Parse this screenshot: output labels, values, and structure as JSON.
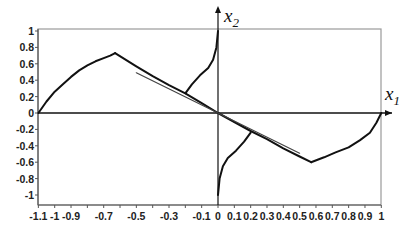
{
  "chart_data": {
    "type": "line",
    "title": "",
    "xlabel": "x1",
    "ylabel": "x2",
    "xlabel_parts": {
      "base": "x",
      "sub": "1"
    },
    "ylabel_parts": {
      "base": "x",
      "sub": "2"
    },
    "xlim": [
      -1.1,
      1.0
    ],
    "ylim": [
      -1.1,
      1.05
    ],
    "grid": false,
    "legend": null,
    "x_ticks": [
      "-1.1",
      "-1",
      "-0.9",
      "-0.7",
      "-0.5",
      "-0.3",
      "-0.1",
      "0",
      "0.1",
      "0.2",
      "0.3",
      "0.4",
      "0.5",
      "0.6",
      "0.7",
      "0.8",
      "0.9",
      "1"
    ],
    "x_tick_values": [
      -1.1,
      -1.0,
      -0.9,
      -0.7,
      -0.5,
      -0.3,
      -0.1,
      0,
      0.1,
      0.2,
      0.3,
      0.4,
      0.5,
      0.6,
      0.7,
      0.8,
      0.9,
      1.0
    ],
    "y_ticks": [
      "1",
      "0.8",
      "0.6",
      "0.4",
      "0.2",
      "0",
      "-0.2",
      "-0.4",
      "-0.6",
      "-0.8",
      "-1"
    ],
    "y_tick_values": [
      1,
      0.8,
      0.6,
      0.4,
      0.2,
      0,
      -0.2,
      -0.4,
      -0.6,
      -0.8,
      -1
    ],
    "series": [
      {
        "name": "trajectory-left-arc",
        "x": [
          -1.1,
          -1.05,
          -1.0,
          -0.95,
          -0.9,
          -0.85,
          -0.8,
          -0.75,
          -0.7,
          -0.66,
          -0.63
        ],
        "y": [
          0.0,
          0.14,
          0.26,
          0.35,
          0.44,
          0.52,
          0.58,
          0.63,
          0.67,
          0.7,
          0.73
        ]
      },
      {
        "name": "trajectory-diagonal",
        "x": [
          -0.63,
          -0.5,
          -0.4,
          -0.3,
          -0.2,
          -0.1,
          0.0,
          0.1,
          0.2,
          0.3,
          0.4,
          0.5,
          0.57
        ],
        "y": [
          0.73,
          0.57,
          0.45,
          0.34,
          0.24,
          0.12,
          0.0,
          -0.11,
          -0.22,
          -0.32,
          -0.43,
          -0.53,
          -0.6
        ]
      },
      {
        "name": "trajectory-right-arc",
        "x": [
          0.57,
          0.65,
          0.72,
          0.8,
          0.87,
          0.93,
          0.97,
          1.0
        ],
        "y": [
          -0.6,
          -0.54,
          -0.48,
          -0.42,
          -0.33,
          -0.24,
          -0.12,
          0.0
        ]
      },
      {
        "name": "switching-line-segment",
        "x": [
          -0.5,
          0.0,
          0.5
        ],
        "y": [
          0.49,
          0.0,
          -0.49
        ]
      },
      {
        "name": "upper-branch",
        "x": [
          -0.2,
          -0.16,
          -0.11,
          -0.06,
          -0.03,
          -0.01,
          0.0
        ],
        "y": [
          0.24,
          0.35,
          0.46,
          0.55,
          0.65,
          0.8,
          1.0
        ]
      },
      {
        "name": "lower-branch",
        "x": [
          0.2,
          0.16,
          0.11,
          0.06,
          0.03,
          0.01,
          0.0
        ],
        "y": [
          -0.24,
          -0.35,
          -0.46,
          -0.55,
          -0.65,
          -0.8,
          -1.0
        ]
      }
    ]
  }
}
